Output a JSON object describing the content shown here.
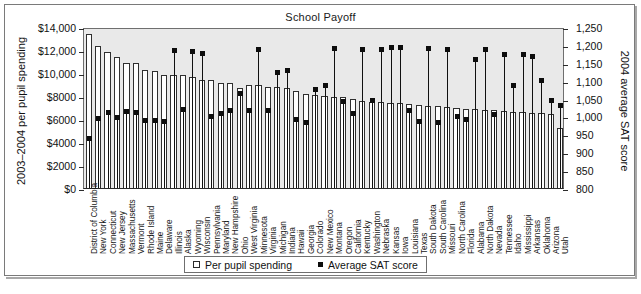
{
  "figure": {
    "title": "School Payoff",
    "caption": ""
  },
  "legend": [
    {
      "label": "Per pupil spending",
      "marker": "open-square",
      "color": "#ffffff"
    },
    {
      "label": "Average SAT score",
      "marker": "filled-square",
      "color": "#0d0d0d"
    }
  ],
  "axes": {
    "left": {
      "title": "2003–2004 per pupil spending",
      "ticks": [
        "$0",
        "$2000",
        "$4000",
        "$6000",
        "$8000",
        "$10,000",
        "$12,000",
        "$14,000"
      ],
      "min": 0,
      "max": 14000,
      "step": 2000
    },
    "right": {
      "title": "2004 average SAT score",
      "ticks": [
        "800",
        "850",
        "900",
        "950",
        "1,000",
        "1,050",
        "1,100",
        "1,150",
        "1,200",
        "1,250"
      ],
      "min": 800,
      "max": 1250,
      "step": 50
    }
  },
  "chart_data": {
    "type": "bar",
    "title": "School Payoff",
    "xlabel": "",
    "ylabel": "2003–2004 per pupil spending",
    "ylabel2": "2004 average SAT score",
    "ylim": [
      0,
      14000
    ],
    "ylim2": [
      800,
      1250
    ],
    "grid": false,
    "legend_position": "bottom",
    "categories": [
      "District of Columbia",
      "New York",
      "Connecticut",
      "New Jersey",
      "Massachusetts",
      "Vermont",
      "Rhode Island",
      "Maine",
      "Delaware",
      "Illinois",
      "Alaska",
      "Wyoming",
      "Wisconsin",
      "Pennsylvania",
      "Maryland",
      "New Hampshire",
      "Ohio",
      "West Virginia",
      "Minnesota",
      "Virginia",
      "Michigan",
      "Indiana",
      "Hawaii",
      "Georgia",
      "Colorado",
      "New Mexico",
      "Montana",
      "Oregon",
      "California",
      "Kentucky",
      "Washington",
      "Nebraska",
      "Kansas",
      "Iowa",
      "Louisiana",
      "Texas",
      "South Dakota",
      "South Carolina",
      "Missouri",
      "North Carolina",
      "Florida",
      "Alabama",
      "North Dakota",
      "Nevada",
      "Tennessee",
      "Idaho",
      "Mississippi",
      "Arkansas",
      "Oklahoma",
      "Arizona",
      "Utah"
    ],
    "series": [
      {
        "name": "Per pupil spending",
        "axis": "left",
        "type": "bar",
        "values": [
          13400,
          12350,
          11800,
          11400,
          10850,
          10850,
          10300,
          10200,
          9800,
          9850,
          9850,
          9650,
          9400,
          9350,
          9150,
          9100,
          8700,
          9000,
          9000,
          8800,
          8750,
          8700,
          8400,
          8200,
          8050,
          8000,
          7950,
          7900,
          7700,
          7600,
          7500,
          7450,
          7400,
          7350,
          7300,
          7250,
          7150,
          7100,
          7050,
          7000,
          6900,
          6850,
          6800,
          6750,
          6700,
          6650,
          6600,
          6550,
          6500,
          6450,
          5250
        ]
      },
      {
        "name": "Average SAT score",
        "axis": "right",
        "type": "scatter",
        "values": [
          945,
          1000,
          1018,
          1003,
          1019,
          1018,
          994,
          995,
          992,
          1190,
          1025,
          1188,
          1181,
          1006,
          1015,
          1021,
          1070,
          1021,
          1193,
          1022,
          1128,
          1135,
          997,
          990,
          1080,
          1091,
          1195,
          1046,
          1013,
          1192,
          1051,
          1194,
          1198,
          1197,
          1022,
          992,
          1196,
          989,
          1193,
          1006,
          998,
          1164,
          1194,
          1012,
          1180,
          1091,
          1180,
          1172,
          1107,
          1050,
          1037
        ]
      }
    ]
  }
}
